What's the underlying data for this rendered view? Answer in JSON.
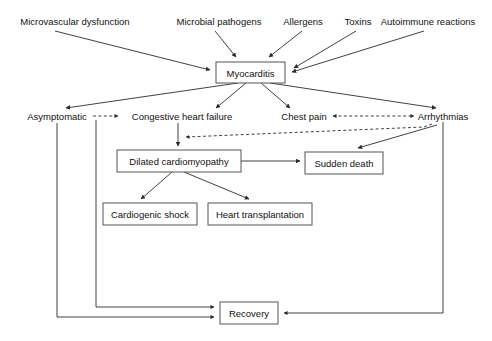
{
  "diagram": {
    "colors": {
      "background": "#ffffff",
      "text": "#111111",
      "line": "#2b2b2b",
      "box_border": "#555555"
    },
    "causes": [
      {
        "id": "microvascular-dysfunction",
        "label": "Microvascular dysfunction",
        "x": 75,
        "y": 25
      },
      {
        "id": "microbial-pathogens",
        "label": "Microbial pathogens",
        "x": 219,
        "y": 25
      },
      {
        "id": "allergens",
        "label": "Allergens",
        "x": 303,
        "y": 25
      },
      {
        "id": "toxins",
        "label": "Toxins",
        "x": 358,
        "y": 25
      },
      {
        "id": "autoimmune-reactions",
        "label": "Autoimmune reactions",
        "x": 428,
        "y": 25
      }
    ],
    "central": {
      "id": "myocarditis",
      "label": "Myocarditis",
      "x": 216,
      "y": 62,
      "w": 69,
      "h": 21
    },
    "outcomes": [
      {
        "id": "asymptomatic",
        "label": "Asymptomatic",
        "x": 57,
        "y": 117
      },
      {
        "id": "congestive-heart-failure",
        "label": "Congestive heart failure",
        "x": 182,
        "y": 117
      },
      {
        "id": "chest-pain",
        "label": "Chest pain",
        "x": 304,
        "y": 117
      },
      {
        "id": "arrhythmias",
        "label": "Arrhythmias",
        "x": 443,
        "y": 117
      }
    ],
    "boxes": [
      {
        "id": "dilated-cardiomyopathy",
        "label": "Dilated cardiomyopathy",
        "x": 117,
        "y": 150,
        "w": 124,
        "h": 22
      },
      {
        "id": "sudden-death",
        "label": "Sudden death",
        "x": 305,
        "y": 152,
        "w": 78,
        "h": 22
      },
      {
        "id": "cardiogenic-shock",
        "label": "Cardiogenic shock",
        "x": 103,
        "y": 203,
        "w": 94,
        "h": 22
      },
      {
        "id": "heart-transplantation",
        "label": "Heart transplantation",
        "x": 208,
        "y": 203,
        "w": 104,
        "h": 22
      },
      {
        "id": "recovery",
        "label": "Recovery",
        "x": 220,
        "y": 302,
        "w": 58,
        "h": 22
      }
    ],
    "edges": [
      {
        "id": "microvascular-to-myocarditis",
        "style": "solid",
        "from": "microvascular-dysfunction",
        "to": "myocarditis"
      },
      {
        "id": "microbial-to-myocarditis",
        "style": "solid",
        "from": "microbial-pathogens",
        "to": "myocarditis"
      },
      {
        "id": "allergens-to-myocarditis",
        "style": "solid",
        "from": "allergens",
        "to": "myocarditis"
      },
      {
        "id": "toxins-to-myocarditis",
        "style": "solid",
        "from": "toxins",
        "to": "myocarditis"
      },
      {
        "id": "autoimmune-to-myocarditis",
        "style": "solid",
        "from": "autoimmune-reactions",
        "to": "myocarditis"
      },
      {
        "id": "myocarditis-to-asymptomatic",
        "style": "solid",
        "from": "myocarditis",
        "to": "asymptomatic"
      },
      {
        "id": "myocarditis-to-chf",
        "style": "solid",
        "from": "myocarditis",
        "to": "congestive-heart-failure"
      },
      {
        "id": "myocarditis-to-chest-pain",
        "style": "solid",
        "from": "myocarditis",
        "to": "chest-pain"
      },
      {
        "id": "myocarditis-to-arrhythmias",
        "style": "solid",
        "from": "myocarditis",
        "to": "arrhythmias"
      },
      {
        "id": "asymptomatic-to-chf",
        "style": "dashed",
        "from": "asymptomatic",
        "to": "congestive-heart-failure"
      },
      {
        "id": "chest-pain-arrhythmias",
        "style": "dashed-bidirectional",
        "from": "chest-pain",
        "to": "arrhythmias"
      },
      {
        "id": "arrhythmias-to-dcm",
        "style": "dashed",
        "from": "arrhythmias",
        "to": "dilated-cardiomyopathy"
      },
      {
        "id": "chf-to-dcm",
        "style": "solid",
        "from": "congestive-heart-failure",
        "to": "dilated-cardiomyopathy"
      },
      {
        "id": "dcm-to-sudden-death",
        "style": "solid",
        "from": "dilated-cardiomyopathy",
        "to": "sudden-death"
      },
      {
        "id": "arrhythmias-to-sudden-death",
        "style": "solid",
        "from": "arrhythmias",
        "to": "sudden-death"
      },
      {
        "id": "dcm-to-cardiogenic-shock",
        "style": "solid",
        "from": "dilated-cardiomyopathy",
        "to": "cardiogenic-shock"
      },
      {
        "id": "dcm-to-heart-transplantation",
        "style": "solid",
        "from": "dilated-cardiomyopathy",
        "to": "heart-transplantation"
      },
      {
        "id": "chf-to-recovery",
        "style": "solid",
        "from": "congestive-heart-failure",
        "to": "recovery"
      },
      {
        "id": "asymptomatic-to-recovery",
        "style": "solid",
        "from": "asymptomatic",
        "to": "recovery"
      },
      {
        "id": "arrhythmias-to-recovery",
        "style": "solid",
        "from": "arrhythmias",
        "to": "recovery"
      }
    ]
  }
}
